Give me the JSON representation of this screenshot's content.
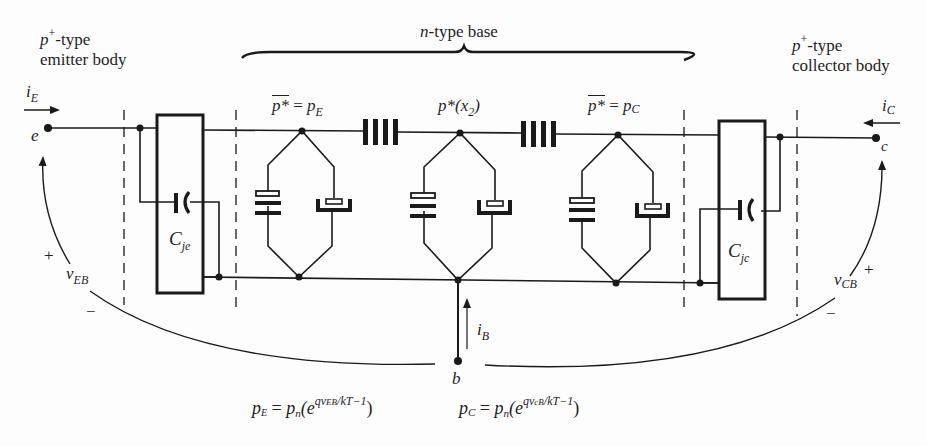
{
  "diagram": {
    "regions": {
      "emitter": {
        "line1_base": "p",
        "line1_sup": "+",
        "line1_rest": "-type",
        "line2": "emitter body"
      },
      "base": {
        "label_italic": "n",
        "label_rest": "-type base"
      },
      "collector": {
        "line1_base": "p",
        "line1_sup": "+",
        "line1_rest": "-type",
        "line2": "collector body"
      }
    },
    "terminals": {
      "emitter": "e",
      "collector": "c",
      "base": "b"
    },
    "currents": {
      "emitter": {
        "sym": "i",
        "sub": "E"
      },
      "collector": {
        "sym": "i",
        "sub": "C"
      },
      "base": {
        "sym": "i",
        "sub": "B"
      }
    },
    "voltages": {
      "emitter_base": {
        "sym": "v",
        "sub": "EB",
        "plus": "+",
        "minus": "−"
      },
      "collector_base": {
        "sym": "v",
        "sub": "CB",
        "plus": "+",
        "minus": "−"
      }
    },
    "capacitors": {
      "emitter_junction": {
        "sym": "C",
        "sub": "je"
      },
      "collector_junction": {
        "sym": "C",
        "sub": "jc"
      }
    },
    "node_labels": {
      "left": {
        "over": "p*",
        "eq": " = ",
        "rhs": "p",
        "rhs_sub": "E"
      },
      "middle": {
        "text": "p*(x",
        "sub": "2",
        "close": ")"
      },
      "right": {
        "over": "p*",
        "eq": " = ",
        "rhs": "p",
        "rhs_sub": "C"
      }
    },
    "equations": {
      "left": {
        "lhs": "p",
        "lhs_sub": "E",
        "eq": " = ",
        "pn": "p",
        "pn_sub": "n",
        "open": "(e",
        "exp": "qv",
        "exp_sub": "EB",
        "exp_rest": "/kT−1",
        "close": ")"
      },
      "right": {
        "lhs": "p",
        "lhs_sub": "C",
        "eq": " = ",
        "pn": "p",
        "pn_sub": "n",
        "open": "(e",
        "exp": "qv",
        "exp_sub": "cB",
        "exp_rest": "/kT−1",
        "close": ")"
      }
    },
    "colors": {
      "ink": "#1a1a1a",
      "background": "#fdfdfd"
    }
  }
}
